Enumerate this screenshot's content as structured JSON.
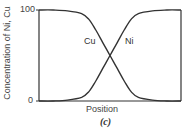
{
  "chart_data": {
    "type": "line",
    "title": "",
    "caption": "(c)",
    "xlabel": "Position",
    "ylabel": "Concentration of Ni, Cu",
    "yticks": [
      "0",
      "100"
    ],
    "ylim": [
      0,
      100
    ],
    "xlim": [
      0,
      1
    ],
    "grid": false,
    "legend": "inline labels",
    "x": [
      0.0,
      0.1,
      0.2,
      0.3,
      0.35,
      0.4,
      0.45,
      0.5,
      0.55,
      0.6,
      0.65,
      0.7,
      0.8,
      0.9,
      1.0
    ],
    "series": [
      {
        "name": "Cu",
        "values": [
          100,
          100,
          99,
          96,
          90,
          78,
          64,
          50,
          36,
          22,
          10,
          4,
          1,
          0,
          0
        ]
      },
      {
        "name": "Ni",
        "values": [
          0,
          0,
          1,
          4,
          10,
          22,
          36,
          50,
          64,
          78,
          90,
          96,
          99,
          100,
          100
        ]
      }
    ]
  }
}
